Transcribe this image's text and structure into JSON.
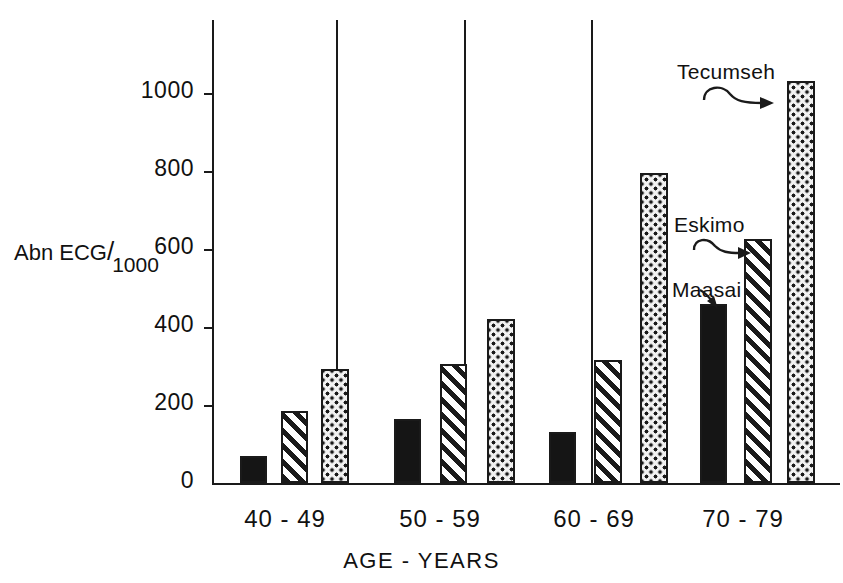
{
  "chart_data": {
    "type": "bar",
    "title": "",
    "xlabel": "AGE - YEARS",
    "ylabel": "Abn ECG/1000",
    "ylabel_parts": {
      "main": "Abn ECG",
      "slash": "/",
      "denominator": "1000"
    },
    "categories": [
      "40 - 49",
      "50 - 59",
      "60 - 69",
      "70 - 79"
    ],
    "series": [
      {
        "name": "Maasai",
        "pattern": "solid-black",
        "values": [
          70,
          165,
          130,
          460
        ]
      },
      {
        "name": "Eskimo",
        "pattern": "diagonal-hatch",
        "values": [
          185,
          305,
          315,
          625
        ]
      },
      {
        "name": "Tecumseh",
        "pattern": "dotted",
        "values": [
          293,
          420,
          795,
          1030
        ]
      }
    ],
    "ylim": [
      0,
      1180
    ],
    "yticks": [
      0,
      200,
      400,
      600,
      800,
      1000
    ],
    "ytick_labels": [
      "0",
      "200",
      "400",
      "600",
      "800",
      "1000"
    ],
    "grid": false,
    "legend": "annotations-inline",
    "annotations": [
      {
        "label": "Tecumseh",
        "series": "Tecumseh",
        "group": "70 - 79"
      },
      {
        "label": "Eskimo",
        "series": "Eskimo",
        "group": "70 - 79"
      },
      {
        "label": "Maasai",
        "series": "Maasai",
        "group": "70 - 79"
      }
    ],
    "colors": {
      "ink": "#1a1a1a",
      "background": "#ffffff"
    }
  }
}
